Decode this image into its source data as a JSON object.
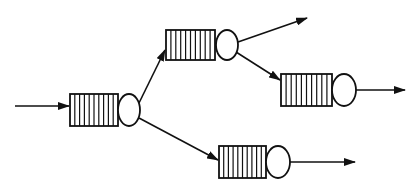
{
  "diagram": {
    "type": "queueing-network",
    "colors": {
      "stroke": "#111111",
      "background": "#ffffff"
    },
    "nodes": [
      {
        "id": "queue-1",
        "label": "",
        "buffer": {
          "x": 70,
          "y": 94,
          "w": 48,
          "h": 32,
          "slots": 10
        },
        "server": {
          "cx": 129,
          "cy": 110,
          "rx": 11,
          "ry": 16
        }
      },
      {
        "id": "queue-2",
        "label": "",
        "buffer": {
          "x": 166,
          "y": 30,
          "w": 49,
          "h": 30,
          "slots": 10
        },
        "server": {
          "cx": 227,
          "cy": 45,
          "rx": 11,
          "ry": 15
        }
      },
      {
        "id": "queue-3",
        "label": "",
        "buffer": {
          "x": 281,
          "y": 74,
          "w": 51,
          "h": 32,
          "slots": 10
        },
        "server": {
          "cx": 344,
          "cy": 90,
          "rx": 12,
          "ry": 16
        }
      },
      {
        "id": "queue-4",
        "label": "",
        "buffer": {
          "x": 219,
          "y": 146,
          "w": 47,
          "h": 32,
          "slots": 10
        },
        "server": {
          "cx": 278,
          "cy": 162,
          "rx": 12,
          "ry": 16
        }
      }
    ],
    "edges": [
      {
        "id": "arrival",
        "from": "external",
        "to": "queue-1",
        "x1": 15,
        "y1": 106,
        "x2": 69,
        "y2": 106
      },
      {
        "id": "q1-to-q2",
        "from": "queue-1",
        "to": "queue-2",
        "x1": 139,
        "y1": 103,
        "x2": 165,
        "y2": 50
      },
      {
        "id": "q1-to-q4",
        "from": "queue-1",
        "to": "queue-4",
        "x1": 139,
        "y1": 118,
        "x2": 218,
        "y2": 160
      },
      {
        "id": "q2-exit",
        "from": "queue-2",
        "to": "external",
        "x1": 238,
        "y1": 42,
        "x2": 307,
        "y2": 18
      },
      {
        "id": "q2-to-q3",
        "from": "queue-2",
        "to": "queue-3",
        "x1": 236,
        "y1": 52,
        "x2": 280,
        "y2": 80
      },
      {
        "id": "q3-exit",
        "from": "queue-3",
        "to": "external",
        "x1": 356,
        "y1": 90,
        "x2": 405,
        "y2": 90
      },
      {
        "id": "q4-exit",
        "from": "queue-4",
        "to": "external",
        "x1": 290,
        "y1": 162,
        "x2": 355,
        "y2": 162
      }
    ]
  }
}
